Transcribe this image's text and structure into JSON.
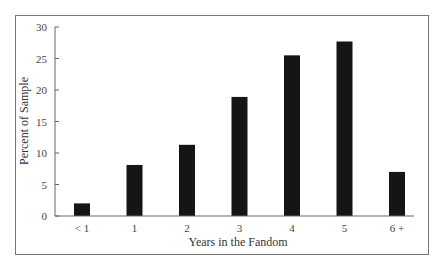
{
  "chart_data": {
    "type": "bar",
    "title": "",
    "xlabel": "Years in the Fandom",
    "ylabel": "Percent of Sample",
    "categories": [
      "< 1",
      "1",
      "2",
      "3",
      "4",
      "5",
      "6 +"
    ],
    "values": [
      2,
      8.1,
      11.3,
      18.9,
      25.5,
      27.7,
      7
    ],
    "ylim": [
      0,
      30
    ],
    "yticks": [
      0,
      5,
      10,
      15,
      20,
      25,
      30
    ],
    "grid": false,
    "legend": "none",
    "bar_color": "#151515"
  }
}
